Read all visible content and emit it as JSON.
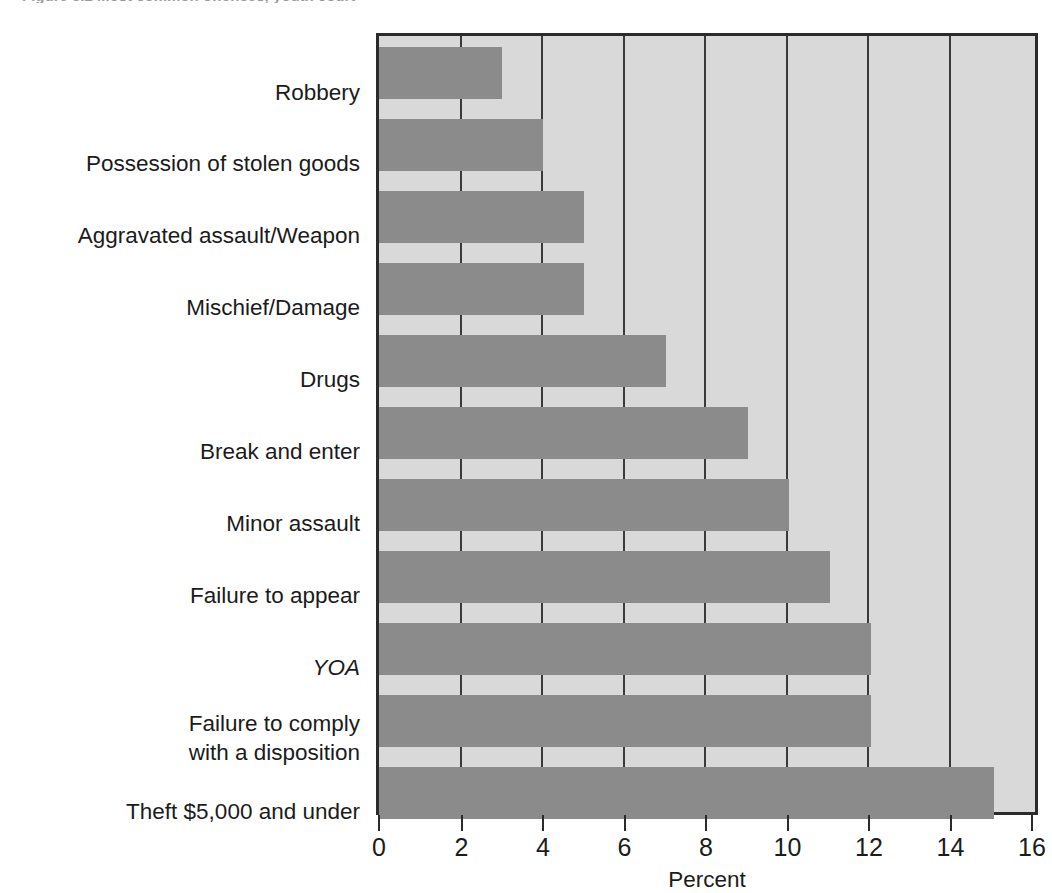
{
  "caption": {
    "text": "Figure 3.2  Most common offences, youth court"
  },
  "chart_data": {
    "type": "bar",
    "orientation": "horizontal",
    "title": "",
    "subtitle": "",
    "xlabel": "Percent",
    "ylabel": "",
    "xlim": [
      0,
      16
    ],
    "xticks": [
      0,
      2,
      4,
      6,
      8,
      10,
      12,
      14,
      16
    ],
    "xtick_labels": [
      "0",
      "2",
      "4",
      "6",
      "8",
      "10",
      "12",
      "14",
      "16"
    ],
    "grid": true,
    "grid_axis": "x",
    "legend": false,
    "legend_position": "none",
    "categories": [
      "Robbery",
      "Possession of stolen goods",
      "Aggravated assault/Weapon",
      "Mischief/Damage",
      "Drugs",
      "Break and enter",
      "Minor assault",
      "Failure to appear",
      "YOA",
      "Failure to comply\nwith a disposition",
      "Theft $5,000 and under"
    ],
    "category_styles": [
      "normal",
      "normal",
      "normal",
      "normal",
      "normal",
      "normal",
      "normal",
      "normal",
      "italic",
      "normal",
      "normal"
    ],
    "values": [
      3,
      4,
      5,
      5,
      7,
      9,
      10,
      11,
      12,
      12,
      15
    ],
    "series": [
      {
        "name": "Percent of youth court cases",
        "values": [
          3,
          4,
          5,
          5,
          7,
          9,
          10,
          11,
          12,
          12,
          15
        ]
      }
    ],
    "colors": {
      "bar_fill": "#8b8b8b",
      "plot_background": "#d9d9d9",
      "axis_line": "#2b2b2b",
      "gridline": "#3a3a3a",
      "text": "#1b1b1b",
      "page_background": "#ffffff"
    }
  },
  "labels": {
    "rows": [
      {
        "text": "Robbery",
        "style": "normal"
      },
      {
        "text": "Possession of stolen goods",
        "style": "normal"
      },
      {
        "text": "Aggravated assault/Weapon",
        "style": "normal"
      },
      {
        "text": "Mischief/Damage",
        "style": "normal"
      },
      {
        "text": "Drugs",
        "style": "normal"
      },
      {
        "text": "Break and enter",
        "style": "normal"
      },
      {
        "text": "Minor assault",
        "style": "normal"
      },
      {
        "text": "Failure to appear",
        "style": "normal"
      },
      {
        "text": "YOA",
        "style": "italic"
      },
      {
        "text": "Failure to comply",
        "text2": "with a disposition",
        "style": "normal"
      },
      {
        "text": "Theft $5,000 and under",
        "style": "normal"
      }
    ],
    "line_a": "Failure to comply",
    "line_b": "with a disposition"
  },
  "axis": {
    "x_title": "Percent",
    "ticks": [
      "0",
      "2",
      "4",
      "6",
      "8",
      "10",
      "12",
      "14",
      "16"
    ]
  }
}
